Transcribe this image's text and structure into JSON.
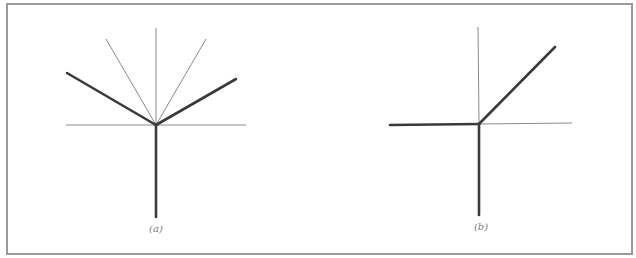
{
  "figure": {
    "panels": [
      {
        "id": "a",
        "caption": "(a)",
        "origin": [
          156,
          125
        ],
        "thin_lines": [
          {
            "name": "horizontal-axis",
            "from": [
              66,
              125
            ],
            "to": [
              246,
              125
            ]
          },
          {
            "name": "vertical-axis-upper",
            "from": [
              156,
              125
            ],
            "to": [
              156,
              28
            ]
          },
          {
            "name": "thin-ray-upper-left",
            "from": [
              156,
              125
            ],
            "to": [
              106,
              39
            ]
          },
          {
            "name": "thin-ray-upper-right",
            "from": [
              156,
              125
            ],
            "to": [
              206,
              39
            ]
          }
        ],
        "thick_lines": [
          {
            "name": "thick-ray-left",
            "from": [
              156,
              125
            ],
            "to": [
              67,
              73
            ]
          },
          {
            "name": "thick-ray-right",
            "from": [
              156,
              125
            ],
            "to": [
              236,
              79
            ]
          },
          {
            "name": "thick-vertical-down",
            "from": [
              156,
              125
            ],
            "to": [
              156,
              217
            ]
          }
        ]
      },
      {
        "id": "b",
        "caption": "(b)",
        "origin": [
          479,
          124
        ],
        "thin_lines": [
          {
            "name": "horizontal-axis-right",
            "from": [
              479,
              124
            ],
            "to": [
              572,
              123
            ]
          },
          {
            "name": "vertical-axis-upper",
            "from": [
              479,
              124
            ],
            "to": [
              478,
              27
            ]
          }
        ],
        "thick_lines": [
          {
            "name": "thick-horizontal-left",
            "from": [
              390,
              125
            ],
            "to": [
              479,
              124
            ]
          },
          {
            "name": "thick-diagonal-up-right",
            "from": [
              479,
              124
            ],
            "to": [
              555,
              47
            ]
          },
          {
            "name": "thick-vertical-down",
            "from": [
              479,
              124
            ],
            "to": [
              479,
              215
            ]
          }
        ]
      }
    ],
    "colors": {
      "frame": "#9a9a9a",
      "thin_line": "#8a8a8a",
      "thick_line": "#3a3a3a",
      "caption": "#7a7a7a"
    }
  }
}
